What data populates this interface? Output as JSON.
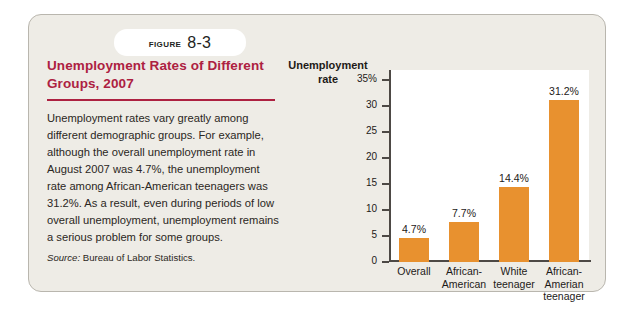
{
  "figure": {
    "tab_word": "Figure",
    "tab_number": "8-3",
    "title": "Unemployment Rates of Different Groups, 2007",
    "body": "Unemployment rates vary greatly among different demographic groups. For example, although the overall unemployment rate in August 2007 was 4.7%, the unemployment rate among African-American teenagers was 31.2%. As a result, even during periods of low overall unemployment, unemployment remains a serious problem for some groups.",
    "source_label": "Source:",
    "source_text": "Bureau of Labor Statistics."
  },
  "colors": {
    "title_red": "#ad2141",
    "bar_orange": "#e8912f",
    "card_background": "#eeece6",
    "plot_background": "#ffffff",
    "axis": "#4d4945"
  },
  "chart_data": {
    "type": "bar",
    "title": "",
    "xlabel": "",
    "ylabel": "Unemployment rate",
    "ylim": [
      0,
      37
    ],
    "grid": false,
    "legend": "none",
    "yticks": [
      "0",
      "5",
      "10",
      "15",
      "20",
      "25",
      "30",
      "35%"
    ],
    "ytick_values": [
      0,
      5,
      10,
      15,
      20,
      25,
      30,
      35
    ],
    "categories": [
      "Overall",
      "African-American",
      "White teenager",
      "African-Amerian teenager"
    ],
    "category_lines": [
      [
        "Overall"
      ],
      [
        "African-",
        "American"
      ],
      [
        "White",
        "teenager"
      ],
      [
        "African-",
        "Amerian",
        "teenager"
      ]
    ],
    "values": [
      4.7,
      7.7,
      14.4,
      31.2
    ],
    "value_labels": [
      "4.7%",
      "7.7%",
      "14.4%",
      "31.2%"
    ]
  }
}
